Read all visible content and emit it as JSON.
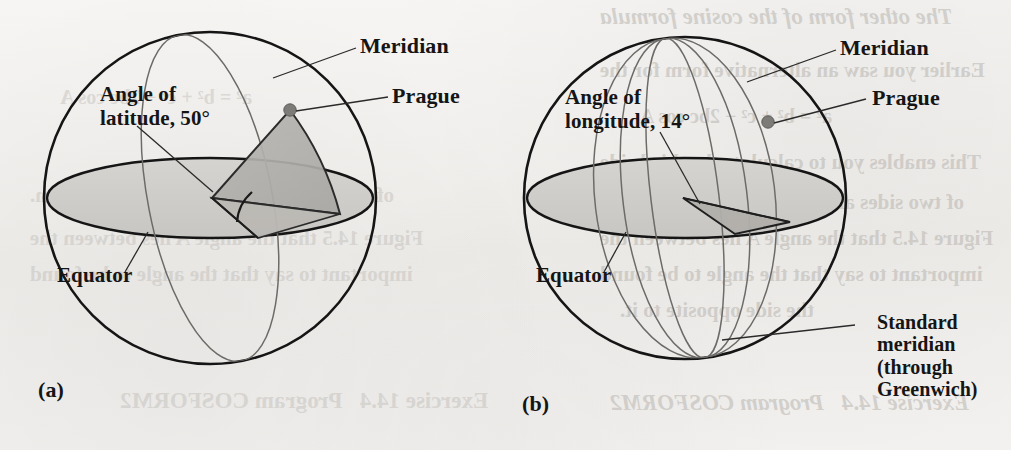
{
  "figure": {
    "caption_a": "(a)",
    "caption_b": "(b)",
    "panel_a": {
      "label_meridian": "Meridian",
      "label_prague": "Prague",
      "label_angle_line1": "Angle of",
      "label_angle_line2": "latitude, 50°",
      "label_equator": "Equator",
      "angle_value": "50°",
      "angle_type": "latitude"
    },
    "panel_b": {
      "label_meridian": "Meridian",
      "label_prague": "Prague",
      "label_angle_line1": "Angle of",
      "label_angle_line2": "longitude, 14°",
      "label_equator": "Equator",
      "label_standard_line1": "Standard",
      "label_standard_line2": "meridian",
      "label_standard_line3": "(through",
      "label_standard_line4": "Greenwich)",
      "angle_value": "14°",
      "angle_type": "longitude"
    }
  },
  "background_bleed": {
    "line1": "The other form of the cosine formula",
    "line2": "Earlier you saw an alternative form for the",
    "line3": "a² = b² + c² − 2bc cos A",
    "line4": "This enables you to calculate the third side",
    "line5": "of two sides and the angle between them.",
    "line6": "Figure 14.5 that the angle A lies between the",
    "line7": "important to say that the angle to be found",
    "line8": "the side opposite to it.",
    "line9": "Exercise 14.4   Program COSFORM2"
  },
  "colors": {
    "ink": "#151515",
    "paper": "#f3f2f0",
    "plane_fill": "#cfcdc9",
    "wedge_fill": "#b4b2ae",
    "wedge_fill_light": "#c4c2be",
    "dot": "#7d7b78",
    "thin_line": "#4a4a4a",
    "ghost_text": "#b9b6b1"
  }
}
